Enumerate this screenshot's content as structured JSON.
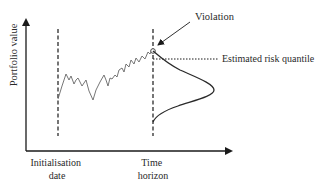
{
  "diagram": {
    "y_axis_label": "Portfolio value",
    "x_labels": {
      "initialisation": [
        "Initialisation",
        "date"
      ],
      "horizon": [
        "Time",
        "horizon"
      ]
    },
    "annotations": {
      "violation": "Violation",
      "quantile": "Estimated risk quantile"
    },
    "colors": {
      "axis": "#1a1a1a",
      "path": "#555555",
      "curve": "#2a2a2a",
      "text": "#2a2a2a"
    },
    "elements": [
      "y-axis with arrow",
      "x-axis (time) with arrow",
      "dashed vertical line at initialisation date",
      "dashed vertical line at time horizon",
      "random-walk portfolio path",
      "violation point (open circle)",
      "dotted estimated risk quantile line",
      "forecast distribution (bell curve) at horizon"
    ]
  }
}
